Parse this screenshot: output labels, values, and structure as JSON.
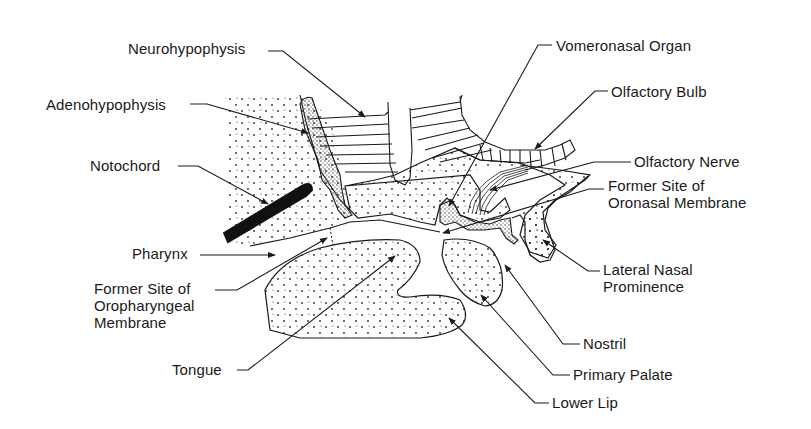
{
  "diagram": {
    "labels": [
      {
        "id": "neurohypophysis",
        "text": "Neurohypophysis",
        "x": 128,
        "y": 40,
        "leader": [
          [
            268,
            51
          ],
          [
            283,
            51
          ],
          [
            365,
            117
          ]
        ]
      },
      {
        "id": "adenohypophysis",
        "text": "Adenohypophysis",
        "x": 46,
        "y": 96,
        "leader": [
          [
            190,
            104
          ],
          [
            207,
            104
          ],
          [
            308,
            133
          ]
        ]
      },
      {
        "id": "notochord",
        "text": "Notochord",
        "x": 90,
        "y": 157,
        "leader": [
          [
            178,
            166
          ],
          [
            198,
            166
          ],
          [
            268,
            204
          ]
        ]
      },
      {
        "id": "pharynx",
        "text": "Pharynx",
        "x": 132,
        "y": 245,
        "leader": [
          [
            200,
            255
          ],
          [
            275,
            255
          ]
        ]
      },
      {
        "id": "oropharyngeal",
        "text": "Former Site of\nOropharyngeal\nMembrane",
        "x": 94,
        "y": 280,
        "leader": [
          [
            215,
            290
          ],
          [
            237,
            290
          ],
          [
            327,
            238
          ]
        ]
      },
      {
        "id": "tongue",
        "text": "Tongue",
        "x": 172,
        "y": 361,
        "leader": [
          [
            237,
            370
          ],
          [
            248,
            370
          ],
          [
            395,
            256
          ]
        ]
      },
      {
        "id": "vomeronasal",
        "text": "Vomeronasal Organ",
        "x": 556,
        "y": 37,
        "leader": [
          [
            552,
            45
          ],
          [
            538,
            45
          ],
          [
            449,
            206
          ]
        ]
      },
      {
        "id": "olfactory-bulb",
        "text": "Olfactory Bulb",
        "x": 611,
        "y": 83,
        "leader": [
          [
            608,
            91
          ],
          [
            595,
            91
          ],
          [
            535,
            149
          ]
        ]
      },
      {
        "id": "olfactory-nerve",
        "text": "Olfactory Nerve",
        "x": 634,
        "y": 153,
        "leader": [
          [
            631,
            162
          ],
          [
            594,
            162
          ],
          [
            490,
            190
          ]
        ]
      },
      {
        "id": "oronasal",
        "text": "Former Site of\nOronasal Membrane",
        "x": 608,
        "y": 177,
        "leader": [
          [
            604,
            189
          ],
          [
            589,
            189
          ],
          [
            443,
            233
          ]
        ]
      },
      {
        "id": "lateral-nasal",
        "text": "Lateral Nasal\nProminence",
        "x": 603,
        "y": 261,
        "leader": [
          [
            600,
            271
          ],
          [
            588,
            271
          ],
          [
            543,
            240
          ]
        ]
      },
      {
        "id": "nostril",
        "text": "Nostril",
        "x": 583,
        "y": 335,
        "leader": [
          [
            580,
            344
          ],
          [
            563,
            344
          ],
          [
            505,
            265
          ]
        ]
      },
      {
        "id": "primary-palate",
        "text": "Primary Palate",
        "x": 573,
        "y": 366,
        "leader": [
          [
            570,
            375
          ],
          [
            553,
            375
          ],
          [
            481,
            295
          ]
        ]
      },
      {
        "id": "lower-lip",
        "text": "Lower Lip",
        "x": 552,
        "y": 394,
        "leader": [
          [
            549,
            403
          ],
          [
            535,
            403
          ],
          [
            449,
            318
          ]
        ]
      }
    ]
  },
  "colors": {
    "ink": "#1a1a1a",
    "background": "#ffffff",
    "stipple": "#2a2a2a"
  }
}
